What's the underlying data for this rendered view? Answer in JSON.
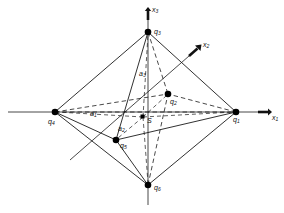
{
  "figure": {
    "name": "octahedron-coordinate-diagram",
    "background_color": "#ffffff",
    "line_color": "#1a1a1a",
    "vertex_color": "#000000",
    "width": 284,
    "height": 213
  },
  "axes": [
    {
      "id": "x1",
      "base": "x",
      "sub": "1",
      "label": "x₁",
      "direction": "right",
      "tip": [
        270,
        112
      ],
      "label_pos": [
        272,
        115
      ]
    },
    {
      "id": "x2",
      "base": "x",
      "sub": "2",
      "label": "x₂",
      "direction": "upper-right",
      "tip": [
        201,
        45
      ],
      "label_pos": [
        203,
        45
      ]
    },
    {
      "id": "x3",
      "base": "x",
      "sub": "3",
      "label": "x₃",
      "direction": "up",
      "tip": [
        148,
        8
      ],
      "label_pos": [
        152,
        9
      ]
    }
  ],
  "vertices": [
    {
      "id": "q1",
      "base": "q",
      "sub": "1",
      "label": "q₁",
      "x": 236,
      "y": 112,
      "label_pos": [
        233,
        119
      ],
      "on_axis": "x1"
    },
    {
      "id": "q2",
      "base": "q",
      "sub": "2",
      "label": "q₂",
      "x": 168,
      "y": 94,
      "label_pos": [
        170,
        101
      ],
      "on_axis": "x2"
    },
    {
      "id": "q3",
      "base": "q",
      "sub": "3",
      "label": "q₃",
      "x": 148,
      "y": 32,
      "label_pos": [
        153,
        31
      ],
      "on_axis": "x3"
    },
    {
      "id": "q4",
      "base": "q",
      "sub": "4",
      "label": "q₄",
      "x": 55,
      "y": 112,
      "label_pos": [
        49,
        121
      ],
      "on_axis": "x1-negative"
    },
    {
      "id": "q5",
      "base": "q",
      "sub": "5",
      "label": "q₅",
      "x": 116,
      "y": 140,
      "label_pos": [
        120,
        145
      ],
      "on_axis": "x2-negative"
    },
    {
      "id": "q6",
      "base": "q",
      "sub": "6",
      "label": "q₆",
      "x": 148,
      "y": 185,
      "label_pos": [
        153,
        188
      ],
      "on_axis": "x3-negative"
    }
  ],
  "center": {
    "id": "S",
    "label": "S",
    "x": 143,
    "y": 117,
    "label_pos": [
      146,
      120
    ],
    "marker": "square"
  },
  "semi_axis_labels": [
    {
      "id": "a1",
      "base": "a",
      "sub": "1",
      "label": "a₁",
      "pos": [
        92,
        113
      ],
      "edge": "S-q4"
    },
    {
      "id": "a2",
      "base": "a",
      "sub": "2",
      "label": "a₂",
      "pos": [
        120,
        128
      ],
      "edge": "S-q5"
    },
    {
      "id": "a3",
      "base": "a",
      "sub": "3",
      "label": "a₃",
      "pos": [
        140,
        74
      ],
      "edge": "S-q3"
    }
  ],
  "edges_solid": [
    [
      "q3",
      "q1"
    ],
    [
      "q3",
      "q4"
    ],
    [
      "q3",
      "q5"
    ],
    [
      "q6",
      "q1"
    ],
    [
      "q6",
      "q4"
    ],
    [
      "q6",
      "q5"
    ],
    [
      "q1",
      "q5"
    ],
    [
      "q4",
      "q5"
    ],
    [
      "q3",
      "q6"
    ]
  ],
  "edges_dashed": [
    [
      "q3",
      "q2"
    ],
    [
      "q6",
      "q2"
    ],
    [
      "q1",
      "q2"
    ],
    [
      "q4",
      "q2"
    ],
    [
      "q4",
      "q1"
    ]
  ],
  "center_rays_dashed": [
    [
      "S",
      "q1"
    ],
    [
      "S",
      "q2"
    ],
    [
      "S",
      "q3"
    ],
    [
      "S",
      "q4"
    ],
    [
      "S",
      "q5"
    ],
    [
      "S",
      "q6"
    ]
  ],
  "style_notes": {
    "solid_edges": "visible octahedron edges",
    "dashed_edges": "hidden edges behind the body",
    "vertex_marker": "filled black dot",
    "center_marker": "small filled black square"
  }
}
